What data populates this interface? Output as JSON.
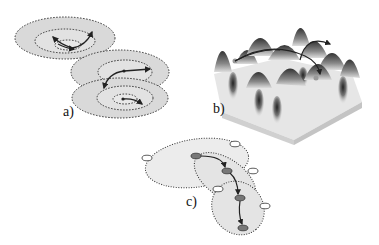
{
  "panels": {
    "a": {
      "label": "a)",
      "description": "Nested dotted concentric ellipses (three stacked basins) with curved arrows moving between inner rings"
    },
    "b": {
      "label": "b)",
      "description": "3D surface landscape with multiple peaks and wells, curved arrows connecting points across the surface"
    },
    "c": {
      "label": "c)",
      "description": "Overlapping dotted ellipses with white and dark gray oval nodes connected by a chain of arrows"
    }
  },
  "colors": {
    "ellipse_fill": "#d9d9d9",
    "ellipse_fill_light": "#ececec",
    "dotted_stroke": "#333333",
    "arrow": "#222222",
    "node_dark": "#777777",
    "node_light": "#ffffff",
    "surface_top": "#e8e8e8",
    "surface_side": "#cfcfcf"
  }
}
